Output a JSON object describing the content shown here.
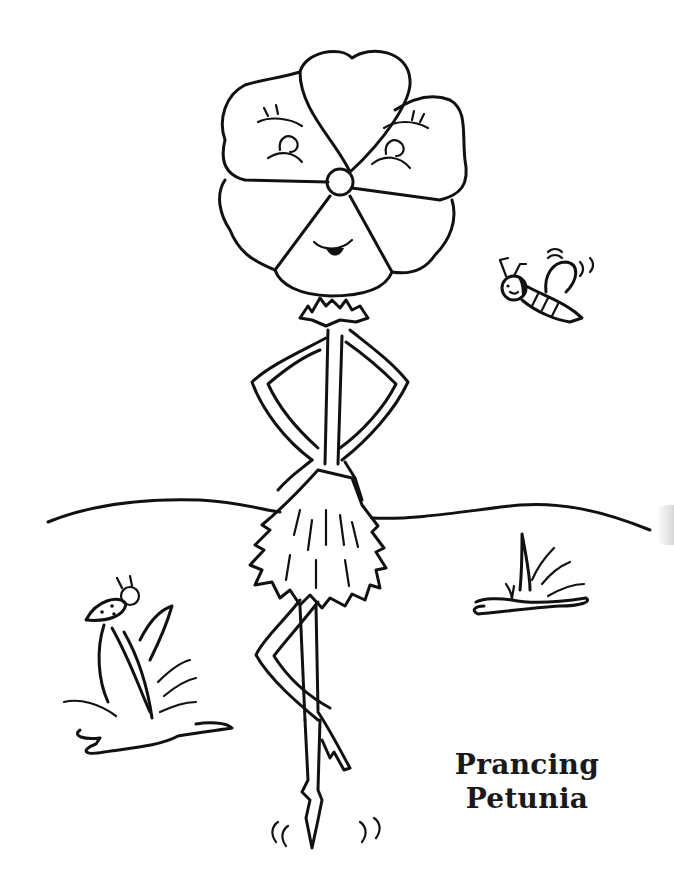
{
  "page": {
    "type": "coloring-page",
    "background_color": "#ffffff",
    "line_color": "#111111"
  },
  "title": {
    "line1": "Prancing",
    "line2": "Petunia"
  },
  "illustration": {
    "subjects": [
      {
        "name": "petunia-character",
        "description": "Flower-headed figure with five petals, two smiling eyes and a smile, hands on hips, leafy skirt, legs crossed"
      },
      {
        "name": "bee",
        "description": "Small smiling bee flying in upper right with motion lines"
      },
      {
        "name": "ladybug",
        "description": "Ladybug perched on grass blades at left"
      },
      {
        "name": "grass-tuft-left",
        "description": "Grass tuft with puddle-like ground at lower left"
      },
      {
        "name": "grass-tuft-right",
        "description": "Grass tuft at right middle"
      },
      {
        "name": "horizon-line",
        "description": "Wavy ground line across the page"
      },
      {
        "name": "motion-marks",
        "description": "Small bounce marks near the feet"
      }
    ]
  }
}
